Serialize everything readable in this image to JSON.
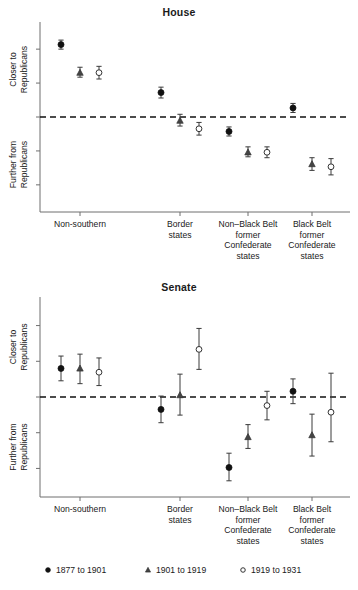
{
  "chart_data": [
    {
      "type": "scatter",
      "title": "House",
      "xlabel": "",
      "ylabel_top": "Closer to Republicans",
      "ylabel_bottom": "Further from Republicans",
      "grid": false,
      "legend_position": "bottom",
      "ylim": [
        -1.05,
        1.05
      ],
      "yticks": [
        -0.75,
        -0.375,
        0,
        0.375,
        0.75
      ],
      "reference_line": 0,
      "categories": [
        "Non-southern",
        "Border states",
        "Non–Black Belt former Confederate states",
        "Black Belt former Confederate states"
      ],
      "series": [
        {
          "name": "1877 to 1901",
          "marker": "filled-circle",
          "values": [
            0.8,
            0.27,
            -0.16,
            0.1
          ],
          "ci_low": [
            0.75,
            0.21,
            -0.21,
            0.05
          ],
          "ci_high": [
            0.85,
            0.33,
            -0.11,
            0.15
          ]
        },
        {
          "name": "1901 to 1919",
          "marker": "filled-triangle",
          "values": [
            0.49,
            -0.04,
            -0.39,
            -0.52
          ],
          "ci_low": [
            0.44,
            -0.1,
            -0.44,
            -0.59
          ],
          "ci_high": [
            0.55,
            0.03,
            -0.33,
            -0.45
          ]
        },
        {
          "name": "1919 to 1931",
          "marker": "open-circle",
          "values": [
            0.49,
            -0.13,
            -0.39,
            -0.55
          ],
          "ci_low": [
            0.42,
            -0.2,
            -0.45,
            -0.64
          ],
          "ci_high": [
            0.56,
            -0.06,
            -0.33,
            -0.46
          ]
        }
      ]
    },
    {
      "type": "scatter",
      "title": "Senate",
      "xlabel": "",
      "ylabel_top": "Closer to Republicans",
      "ylabel_bottom": "Further from Republicans",
      "grid": false,
      "legend_position": "bottom",
      "ylim": [
        -1.05,
        1.05
      ],
      "yticks": [
        -0.75,
        -0.375,
        0,
        0.375,
        0.75
      ],
      "reference_line": 0,
      "categories": [
        "Non-southern",
        "Border states",
        "Non–Black Belt former Confederate states",
        "Black Belt former Confederate states"
      ],
      "series": [
        {
          "name": "1877 to 1901",
          "marker": "filled-circle",
          "values": [
            0.3,
            -0.13,
            -0.74,
            0.06
          ],
          "ci_low": [
            0.17,
            -0.27,
            -0.88,
            -0.07
          ],
          "ci_high": [
            0.43,
            0.01,
            -0.59,
            0.19
          ]
        },
        {
          "name": "1901 to 1919",
          "marker": "filled-triangle",
          "values": [
            0.3,
            0.02,
            -0.42,
            -0.4
          ],
          "ci_low": [
            0.14,
            -0.19,
            -0.54,
            -0.62
          ],
          "ci_high": [
            0.45,
            0.24,
            -0.29,
            -0.18
          ]
        },
        {
          "name": "1919 to 1931",
          "marker": "open-circle",
          "values": [
            0.26,
            0.5,
            -0.09,
            -0.16
          ],
          "ci_low": [
            0.12,
            0.29,
            -0.24,
            -0.47
          ],
          "ci_high": [
            0.41,
            0.72,
            0.06,
            0.25
          ]
        }
      ]
    }
  ],
  "legend": {
    "items": [
      {
        "label": "1877 to 1901",
        "marker": "filled-circle"
      },
      {
        "label": "1901 to 1919",
        "marker": "filled-triangle"
      },
      {
        "label": "1919 to 1931",
        "marker": "open-circle"
      }
    ]
  },
  "axis_labels": {
    "top": "Closer to",
    "top2": "Republicans",
    "bottom": "Further from",
    "bottom2": "Republicans"
  },
  "category_lines": [
    [
      "Non-southern"
    ],
    [
      "Border",
      "states"
    ],
    [
      "Non–Black Belt",
      "former",
      "Confederate",
      "states"
    ],
    [
      "Black Belt",
      "former",
      "Confederate",
      "states"
    ]
  ]
}
